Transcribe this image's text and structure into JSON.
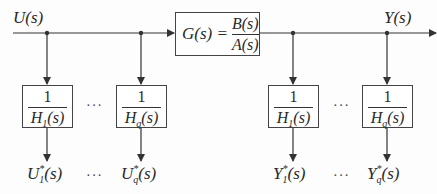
{
  "diagram": {
    "input_label": "U(s)",
    "output_label": "Y(s)",
    "plant": {
      "lhs": "G(s) =",
      "numerator": "B(s)",
      "denominator": "A(s)"
    },
    "filters": [
      {
        "numerator": "1",
        "den_base": "H",
        "den_sub": "1",
        "den_tail": "(s)"
      },
      {
        "numerator": "1",
        "den_base": "H",
        "den_sub": "q",
        "den_tail": "(s)"
      },
      {
        "numerator": "1",
        "den_base": "H",
        "den_sub": "1",
        "den_tail": "(s)"
      },
      {
        "numerator": "1",
        "den_base": "H",
        "den_sub": "q",
        "den_tail": "(s)"
      }
    ],
    "outputs": [
      {
        "base": "U",
        "sup": "*",
        "sub": "1",
        "tail": "(s)"
      },
      {
        "base": "U",
        "sup": "*",
        "sub": "q",
        "tail": "(s)"
      },
      {
        "base": "Y",
        "sup": "*",
        "sub": "1",
        "tail": "(s)"
      },
      {
        "base": "Y",
        "sup": "*",
        "sub": "q",
        "tail": "(s)"
      }
    ],
    "ellipsis": "···",
    "colors": {
      "line": "#333333",
      "box_border": "#444444",
      "background": "#fdfdfd"
    }
  }
}
